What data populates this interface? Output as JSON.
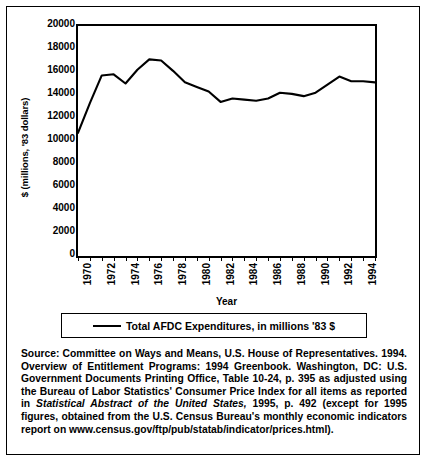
{
  "chart_data": {
    "type": "line",
    "title": "",
    "xlabel": "Year",
    "ylabel": "$ (millions, '83 dollars)",
    "xlim": [
      1970,
      1995
    ],
    "ylim": [
      0,
      20000
    ],
    "ytick_step": 2000,
    "grid": false,
    "legend_position": "below-chart",
    "x": [
      1970,
      1971,
      1972,
      1973,
      1974,
      1975,
      1976,
      1977,
      1978,
      1979,
      1980,
      1981,
      1982,
      1983,
      1984,
      1985,
      1986,
      1987,
      1988,
      1989,
      1990,
      1991,
      1992,
      1993,
      1994,
      1995
    ],
    "series": [
      {
        "name": "Total AFDC Expenditures, in millions '83 $",
        "values": [
          10700,
          13300,
          15700,
          15800,
          15000,
          16200,
          17100,
          17000,
          16100,
          15100,
          14700,
          14300,
          13400,
          13700,
          13600,
          13500,
          13700,
          14200,
          14100,
          13900,
          14200,
          14900,
          15600,
          15200,
          15200,
          15100
        ]
      }
    ],
    "xtick_labels": [
      "1970",
      "1972",
      "1974",
      "1976",
      "1978",
      "1980",
      "1982",
      "1984",
      "1986",
      "1988",
      "1990",
      "1992",
      "1994"
    ],
    "ytick_labels": [
      "0",
      "2000",
      "4000",
      "6000",
      "8000",
      "10000",
      "12000",
      "14000",
      "16000",
      "18000",
      "20000"
    ],
    "line_color": "#000000"
  },
  "legend": {
    "label": "Total AFDC Expenditures, in millions '83 $"
  },
  "axes": {
    "x_title": "Year",
    "y_title": "$ (millions, '83 dollars)"
  },
  "source_note": {
    "part1": "Source: Committee on Ways and Means, U.S. House of Representatives. 1994. Overview of Entitlement Programs: 1994 Greenbook. Washington, DC: U.S. Government Documents Printing Office, Table 10-24, p. 395 as adjusted using the Bureau of Labor Statistics' Consumer Price Index for all items as reported in ",
    "italic": "Statistical Abstract of the United States,",
    "part2": " 1995, p. 492 (except for 1995 figures, obtained from the U.S. Census Bureau's monthly economic indicators report on www.census.gov/ftp/pub/statab/indicator/prices.html)."
  }
}
